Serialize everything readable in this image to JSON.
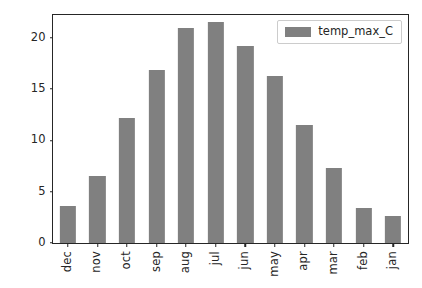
{
  "chart_data": {
    "type": "bar",
    "title": "",
    "xlabel": "",
    "ylabel": "",
    "categories": [
      "dec",
      "nov",
      "oct",
      "sep",
      "aug",
      "jul",
      "jun",
      "may",
      "apr",
      "mar",
      "feb",
      "jan"
    ],
    "series": [
      {
        "name": "temp_max_C",
        "color": "#808080",
        "values": [
          3.6,
          6.5,
          12.2,
          16.8,
          20.9,
          21.5,
          19.2,
          16.3,
          11.5,
          7.3,
          3.4,
          2.6
        ]
      }
    ],
    "ylim": [
      0,
      22.2
    ],
    "yticks": [
      0,
      5,
      10,
      15,
      20
    ],
    "ytick_labels": [
      "0",
      "5",
      "10",
      "15",
      "20"
    ],
    "xtick_labels": [
      "dec",
      "nov",
      "oct",
      "sep",
      "aug",
      "jul",
      "jun",
      "may",
      "apr",
      "mar",
      "feb",
      "jan"
    ],
    "xtick_rotation": 90,
    "grid": false,
    "legend": {
      "position": "upper right",
      "entries": [
        {
          "label": "temp_max_C",
          "color": "#808080"
        }
      ]
    },
    "bar_color": "#808080",
    "axis_color": "#262626",
    "background": "#ffffff"
  },
  "legend": {
    "label": "temp_max_C"
  }
}
